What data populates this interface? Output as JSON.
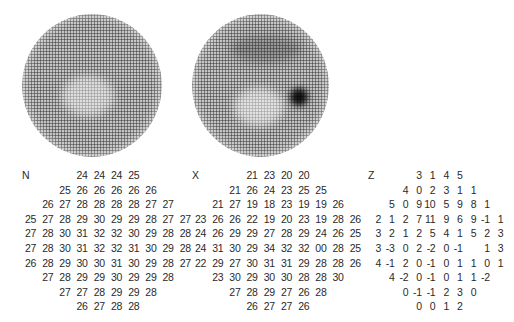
{
  "discs": [
    {
      "id": "left",
      "name": "threshold-greyscale-map",
      "left": 22,
      "top": 14,
      "size": 140
    },
    {
      "id": "right",
      "name": "comparison-greyscale-map",
      "left": 191,
      "top": 14,
      "size": 140
    }
  ],
  "grids": {
    "N": {
      "label": "N",
      "rows": [
        {
          "offset": 3,
          "values": [
            "24",
            "24",
            "24",
            "25"
          ]
        },
        {
          "offset": 2,
          "values": [
            "25",
            "26",
            "26",
            "26",
            "26",
            "26"
          ]
        },
        {
          "offset": 1,
          "values": [
            "26",
            "27",
            "28",
            "28",
            "28",
            "28",
            "27",
            "27"
          ]
        },
        {
          "offset": 0,
          "values": [
            "25",
            "27",
            "28",
            "29",
            "30",
            "29",
            "29",
            "28",
            "27",
            "27"
          ]
        },
        {
          "offset": 0,
          "values": [
            "27",
            "28",
            "30",
            "31",
            "32",
            "32",
            "30",
            "29",
            "28",
            "28"
          ]
        },
        {
          "offset": 0,
          "values": [
            "27",
            "28",
            "30",
            "31",
            "32",
            "32",
            "31",
            "30",
            "29",
            "28"
          ]
        },
        {
          "offset": 0,
          "values": [
            "26",
            "28",
            "29",
            "30",
            "30",
            "31",
            "30",
            "29",
            "28",
            "27"
          ]
        },
        {
          "offset": 1,
          "values": [
            "27",
            "28",
            "29",
            "29",
            "30",
            "29",
            "29",
            "28"
          ]
        },
        {
          "offset": 2,
          "values": [
            "27",
            "27",
            "28",
            "29",
            "29",
            "28"
          ]
        },
        {
          "offset": 3,
          "values": [
            "26",
            "27",
            "28",
            "28"
          ]
        }
      ]
    },
    "X": {
      "label": "X",
      "rows": [
        {
          "offset": 3,
          "values": [
            "21",
            "23",
            "20",
            "20"
          ]
        },
        {
          "offset": 2,
          "values": [
            "21",
            "26",
            "24",
            "23",
            "25",
            "25"
          ]
        },
        {
          "offset": 1,
          "values": [
            "21",
            "27",
            "19",
            "18",
            "23",
            "19",
            "19",
            "26"
          ]
        },
        {
          "offset": 0,
          "values": [
            "23",
            "26",
            "26",
            "22",
            "19",
            "20",
            "23",
            "19",
            "28",
            "26"
          ]
        },
        {
          "offset": 0,
          "values": [
            "24",
            "26",
            "29",
            "29",
            "27",
            "28",
            "29",
            "24",
            "26",
            "25"
          ]
        },
        {
          "offset": 0,
          "values": [
            "24",
            "31",
            "30",
            "29",
            "34",
            "32",
            "32",
            "00",
            "28",
            "25"
          ]
        },
        {
          "offset": 0,
          "values": [
            "22",
            "29",
            "27",
            "30",
            "31",
            "31",
            "29",
            "28",
            "28",
            "26"
          ]
        },
        {
          "offset": 1,
          "values": [
            "23",
            "30",
            "29",
            "30",
            "30",
            "28",
            "28",
            "30"
          ]
        },
        {
          "offset": 2,
          "values": [
            "27",
            "28",
            "29",
            "27",
            "26",
            "28"
          ]
        },
        {
          "offset": 3,
          "values": [
            "26",
            "27",
            "27",
            "26"
          ]
        }
      ]
    },
    "Z": {
      "label": "Z",
      "rows": [
        {
          "offset": 3,
          "values": [
            "3",
            "1",
            "4",
            "5"
          ]
        },
        {
          "offset": 2,
          "values": [
            "4",
            "0",
            "2",
            "3",
            "1",
            "1"
          ]
        },
        {
          "offset": 1,
          "values": [
            "5",
            "0",
            "9",
            "10",
            "5",
            "9",
            "8",
            "1"
          ]
        },
        {
          "offset": 0,
          "values": [
            "2",
            "1",
            "2",
            "7",
            "11",
            "9",
            "6",
            "9",
            "-1",
            "1"
          ]
        },
        {
          "offset": 0,
          "values": [
            "3",
            "2",
            "1",
            "2",
            "5",
            "4",
            "1",
            "5",
            "2",
            "3"
          ]
        },
        {
          "offset": 0,
          "values": [
            "3",
            "-3",
            "0",
            "2",
            "-2",
            "0",
            "-1",
            "",
            "1",
            "3"
          ]
        },
        {
          "offset": 0,
          "values": [
            "4",
            "-1",
            "2",
            "0",
            "-1",
            "0",
            "1",
            "1",
            "0",
            "1"
          ]
        },
        {
          "offset": 1,
          "values": [
            "4",
            "-2",
            "0",
            "-1",
            "0",
            "1",
            "1",
            "-2"
          ]
        },
        {
          "offset": 2,
          "values": [
            "0",
            "-1",
            "-1",
            "2",
            "3",
            "0"
          ]
        },
        {
          "offset": 3,
          "values": [
            "0",
            "0",
            "1",
            "2"
          ]
        }
      ]
    }
  }
}
